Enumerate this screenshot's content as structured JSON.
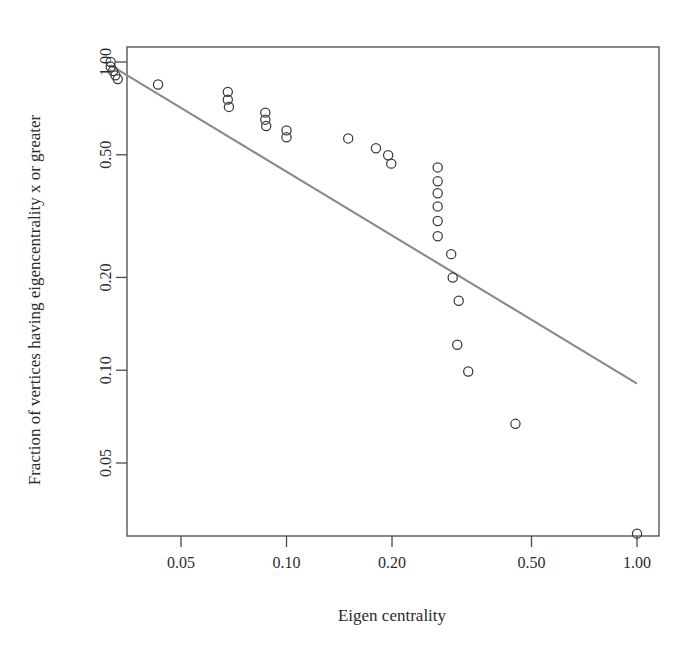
{
  "chart_data": {
    "type": "scatter",
    "title": "",
    "xlabel": "Eigen centrality",
    "ylabel": "Fraction of vertices having eigencentrality x or greater",
    "xscale": "log",
    "yscale": "log",
    "xticks": [
      0.05,
      0.1,
      0.2,
      0.5,
      1.0
    ],
    "xtick_labels": [
      "0.05",
      "0.10",
      "0.20",
      "0.50",
      "1.00"
    ],
    "yticks": [
      0.05,
      0.1,
      0.2,
      0.5,
      1.0
    ],
    "ytick_labels": [
      "0.05",
      "0.10",
      "0.20",
      "0.50",
      "1.00"
    ],
    "xlim": [
      0.028,
      1.3
    ],
    "ylim": [
      0.022,
      1.22
    ],
    "grid": false,
    "legend": null,
    "marker": "open-circle",
    "marker_color": "#3a3a3a",
    "points": [
      {
        "x": 0.0315,
        "y": 1.0
      },
      {
        "x": 0.0315,
        "y": 0.965
      },
      {
        "x": 0.032,
        "y": 0.935
      },
      {
        "x": 0.0325,
        "y": 0.905
      },
      {
        "x": 0.033,
        "y": 0.88
      },
      {
        "x": 0.043,
        "y": 0.845
      },
      {
        "x": 0.068,
        "y": 0.8
      },
      {
        "x": 0.068,
        "y": 0.755
      },
      {
        "x": 0.0685,
        "y": 0.715
      },
      {
        "x": 0.087,
        "y": 0.685
      },
      {
        "x": 0.087,
        "y": 0.65
      },
      {
        "x": 0.0875,
        "y": 0.62
      },
      {
        "x": 0.1,
        "y": 0.6
      },
      {
        "x": 0.1,
        "y": 0.57
      },
      {
        "x": 0.15,
        "y": 0.565
      },
      {
        "x": 0.18,
        "y": 0.525
      },
      {
        "x": 0.195,
        "y": 0.498
      },
      {
        "x": 0.199,
        "y": 0.468
      },
      {
        "x": 0.27,
        "y": 0.455
      },
      {
        "x": 0.27,
        "y": 0.41
      },
      {
        "x": 0.27,
        "y": 0.375
      },
      {
        "x": 0.27,
        "y": 0.34
      },
      {
        "x": 0.27,
        "y": 0.305
      },
      {
        "x": 0.27,
        "y": 0.272
      },
      {
        "x": 0.295,
        "y": 0.238
      },
      {
        "x": 0.298,
        "y": 0.2
      },
      {
        "x": 0.31,
        "y": 0.168
      },
      {
        "x": 0.307,
        "y": 0.121
      },
      {
        "x": 0.33,
        "y": 0.099
      },
      {
        "x": 0.45,
        "y": 0.067
      },
      {
        "x": 1.0,
        "y": 0.0295
      }
    ],
    "fit_line": {
      "label": "power-law fit",
      "color": "#8a8a8a",
      "x_start": 0.0315,
      "y_start": 0.975,
      "x_end": 1.0,
      "y_end": 0.0905
    }
  },
  "axes": {
    "x_title": "Eigen centrality",
    "y_title": "Fraction of vertices having eigencentrality x or greater"
  }
}
